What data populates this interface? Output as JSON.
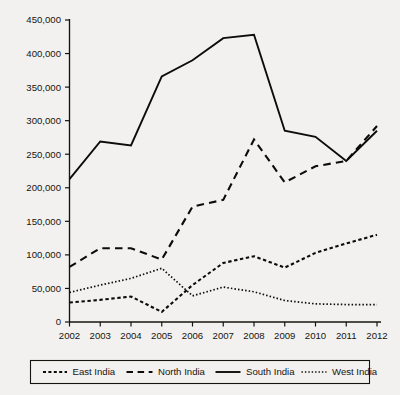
{
  "chart_data": {
    "type": "line",
    "title": "",
    "subtitle": "",
    "xlabel": "",
    "ylabel": "",
    "categories": [
      "2002",
      "2003",
      "2004",
      "2005",
      "2006",
      "2007",
      "2008",
      "2009",
      "2010",
      "2011",
      "2012"
    ],
    "x": [
      2002,
      2003,
      2004,
      2005,
      2006,
      2007,
      2008,
      2009,
      2010,
      2011,
      2012
    ],
    "ylim": [
      0,
      450000
    ],
    "ytick_values": [
      0,
      50000,
      100000,
      150000,
      200000,
      250000,
      300000,
      350000,
      400000,
      450000
    ],
    "ytick_labels": [
      "0",
      "50,000",
      "100,000",
      "150,000",
      "200,000",
      "250,000",
      "300,000",
      "350,000",
      "400,000",
      "450,000"
    ],
    "xtick_labels": [
      "2002",
      "2003",
      "2004",
      "2005",
      "2006",
      "2007",
      "2008",
      "2009",
      "2010",
      "2011",
      "2012"
    ],
    "grid": false,
    "legend_position": "bottom",
    "series": [
      {
        "name": "East India",
        "style": "short-dash",
        "color": "#0d0c0a",
        "values": [
          29000,
          33000,
          38000,
          15000,
          55000,
          88000,
          98000,
          81000,
          103000,
          117000,
          130000
        ]
      },
      {
        "name": "North India",
        "style": "long-dash",
        "color": "#0d0c0a",
        "values": [
          82000,
          110000,
          110000,
          93000,
          172000,
          182000,
          272000,
          208000,
          232000,
          240000,
          292000
        ]
      },
      {
        "name": "South India",
        "style": "solid",
        "color": "#0d0c0a",
        "values": [
          213000,
          269000,
          263000,
          366000,
          390000,
          423000,
          428000,
          285000,
          276000,
          240000,
          285000
        ]
      },
      {
        "name": "West India",
        "style": "dotted",
        "color": "#0d0c0a",
        "values": [
          44000,
          55000,
          65000,
          80000,
          39000,
          52000,
          45000,
          32000,
          27000,
          26000,
          26000
        ]
      }
    ]
  },
  "legend": {
    "items": [
      {
        "label": "East India",
        "style": "short-dash"
      },
      {
        "label": "North India",
        "style": "long-dash"
      },
      {
        "label": "South India",
        "style": "solid"
      },
      {
        "label": "West India",
        "style": "dotted"
      }
    ]
  },
  "axes": {
    "y_max_label": "450,000",
    "y_min_label": "0"
  }
}
